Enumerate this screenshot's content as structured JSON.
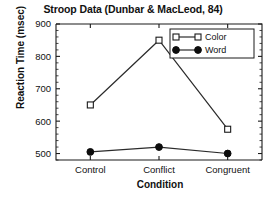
{
  "chart_data": {
    "type": "line",
    "title": "Stroop Data (Dunbar & MacLeod, 84)",
    "xlabel": "Condition",
    "ylabel": "Reaction Time (msec)",
    "categories": [
      "Control",
      "Conflict",
      "Congruent"
    ],
    "series": [
      {
        "name": "Color",
        "marker": "open-square",
        "values": [
          650,
          850,
          575
        ]
      },
      {
        "name": "Word",
        "marker": "filled-circle",
        "values": [
          505,
          520,
          500
        ]
      }
    ],
    "ylim": [
      480,
      900
    ],
    "yticks": [
      500,
      600,
      700,
      800,
      900
    ],
    "ytick_labels": [
      "500",
      "600",
      "700",
      "800",
      "900"
    ],
    "y_minor_tick_step": 20,
    "grid": false,
    "legend_position": "top-right",
    "line_color": "#2b2b2b",
    "axis_color": "#1a1a1a",
    "background_color": "#ffffff"
  },
  "legend": {
    "entries": [
      {
        "label": "Color"
      },
      {
        "label": "Word"
      }
    ]
  }
}
